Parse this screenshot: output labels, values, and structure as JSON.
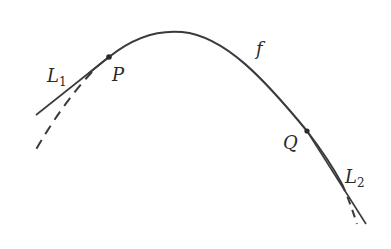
{
  "diagram": {
    "colors": {
      "curve": "#3a3a3a",
      "background": "#ffffff"
    },
    "labels": {
      "curve": "f",
      "point_p": "P",
      "point_q": "Q",
      "line1_main": "L",
      "line1_sub": "1",
      "line2_main": "L",
      "line2_sub": "2"
    },
    "points": {
      "P": [
        109,
        57
      ],
      "Q": [
        307,
        131
      ]
    }
  }
}
